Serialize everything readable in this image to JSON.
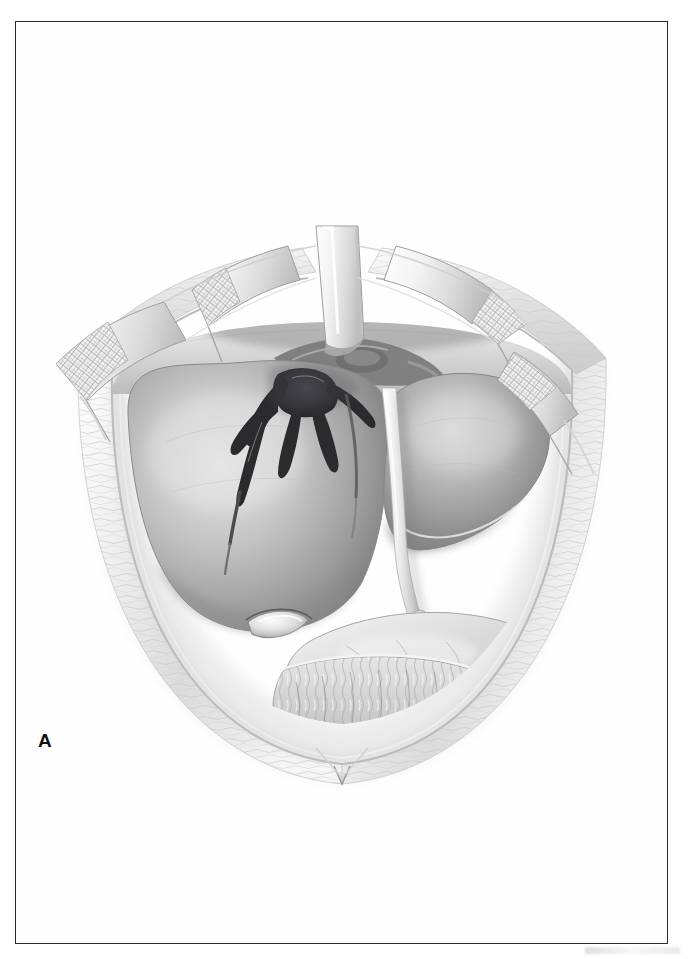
{
  "plate": {
    "panel_label": "A",
    "title": "Open laparotomy exposure of a stellate hepatic laceration",
    "medium": "grayscale medical illustration",
    "frame_color": "#2b2b2e",
    "background_color": "#ffffff"
  },
  "anatomy": {
    "structures": [
      {
        "key": "abdominal_wall",
        "label": "Abdominal wall / wound edge"
      },
      {
        "key": "liver_right_lobe",
        "label": "Right lobe of liver"
      },
      {
        "key": "liver_left_lobe",
        "label": "Left lobe of liver"
      },
      {
        "key": "falciform_ligament",
        "label": "Falciform ligament"
      },
      {
        "key": "round_ligament",
        "label": "Round ligament (ligamentum teres)"
      },
      {
        "key": "gallbladder",
        "label": "Gallbladder fundus"
      },
      {
        "key": "stomach",
        "label": "Stomach"
      },
      {
        "key": "greater_omentum",
        "label": "Greater omentum"
      },
      {
        "key": "diaphragm",
        "label": "Diaphragm / costal margin"
      },
      {
        "key": "laceration",
        "label": "Stellate hepatic laceration"
      }
    ]
  },
  "instruments": {
    "retractors": [
      {
        "key": "retractor-left-lateral",
        "label": "Retractor blade, left lateral"
      },
      {
        "key": "retractor-left-superior",
        "label": "Retractor blade, left superior"
      },
      {
        "key": "retractor-central",
        "label": "Retractor blade, central"
      },
      {
        "key": "retractor-right-superior",
        "label": "Retractor blade, right superior"
      },
      {
        "key": "retractor-right-lateral",
        "label": "Retractor blade, right lateral"
      }
    ],
    "pads_label": "Gauze pad (cross-hatched)"
  },
  "palette": {
    "ink": "#2b2b2e",
    "paper": "#ffffff",
    "organ_light": "#d8d8d8",
    "organ_mid": "#9d9d9d",
    "organ_dark": "#6f6f6f",
    "wall_light": "#f2f2f2",
    "wall_shadow": "#c9c9c9",
    "laceration_dark": "#2e2e30"
  }
}
